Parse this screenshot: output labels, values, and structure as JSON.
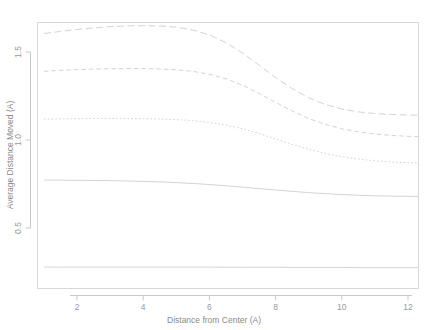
{
  "chart_data": {
    "type": "line",
    "title": "",
    "xlabel": "Distance from Center (A)",
    "ylabel": "Average Distance Moved (A)",
    "xlim": [
      0.8,
      12.4
    ],
    "ylim": [
      0.18,
      1.75
    ],
    "xticks": [
      2,
      4,
      6,
      8,
      10,
      12
    ],
    "xtick_labels": [
      "2",
      "4",
      "6",
      "8",
      "10",
      "12"
    ],
    "yticks": [
      0.5,
      1.0,
      1.5
    ],
    "ytick_labels": [
      "0.5",
      "1.0",
      "1.5"
    ],
    "grid": false,
    "legend": "none",
    "line_color": "#d4d4d4",
    "x": [
      1.0,
      1.5,
      2.0,
      2.5,
      3.0,
      3.5,
      4.0,
      4.5,
      5.0,
      5.5,
      6.0,
      6.5,
      7.0,
      7.5,
      8.0,
      8.5,
      9.0,
      9.5,
      10.0,
      10.5,
      11.0,
      11.5,
      12.0,
      12.3
    ],
    "series": [
      {
        "name": "curve-1",
        "dash": "long-dash",
        "values": [
          1.605,
          1.617,
          1.628,
          1.637,
          1.644,
          1.648,
          1.65,
          1.648,
          1.641,
          1.625,
          1.597,
          1.553,
          1.494,
          1.426,
          1.355,
          1.292,
          1.24,
          1.202,
          1.176,
          1.16,
          1.15,
          1.145,
          1.142,
          1.141
        ]
      },
      {
        "name": "curve-2",
        "dash": "dash",
        "values": [
          1.39,
          1.396,
          1.4,
          1.403,
          1.405,
          1.406,
          1.406,
          1.404,
          1.399,
          1.39,
          1.374,
          1.348,
          1.311,
          1.265,
          1.214,
          1.165,
          1.122,
          1.089,
          1.064,
          1.046,
          1.034,
          1.026,
          1.021,
          1.019
        ]
      },
      {
        "name": "curve-3",
        "dash": "dot",
        "values": [
          1.118,
          1.12,
          1.121,
          1.122,
          1.122,
          1.122,
          1.121,
          1.119,
          1.116,
          1.11,
          1.1,
          1.085,
          1.064,
          1.037,
          1.006,
          0.975,
          0.947,
          0.923,
          0.905,
          0.892,
          0.882,
          0.875,
          0.871,
          0.869
        ]
      },
      {
        "name": "curve-4",
        "dash": "solid",
        "values": [
          0.772,
          0.772,
          0.771,
          0.77,
          0.769,
          0.767,
          0.765,
          0.762,
          0.758,
          0.753,
          0.747,
          0.74,
          0.732,
          0.724,
          0.716,
          0.708,
          0.701,
          0.695,
          0.69,
          0.686,
          0.683,
          0.681,
          0.68,
          0.679
        ]
      },
      {
        "name": "curve-5",
        "dash": "solid",
        "values": [
          0.278,
          0.278,
          0.278,
          0.278,
          0.278,
          0.278,
          0.278,
          0.278,
          0.278,
          0.278,
          0.278,
          0.277,
          0.277,
          0.277,
          0.277,
          0.276,
          0.276,
          0.276,
          0.276,
          0.275,
          0.275,
          0.275,
          0.275,
          0.275
        ]
      }
    ]
  }
}
